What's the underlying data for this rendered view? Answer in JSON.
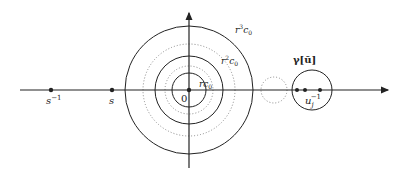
{
  "diagram": {
    "origin": {
      "x": 189,
      "y": 90,
      "label": "0"
    },
    "axes": {
      "horizontal": {
        "x1": 20,
        "x2": 388,
        "y": 90
      },
      "vertical": {
        "x": 189,
        "y1": 12,
        "y2": 168
      }
    },
    "points_left": [
      {
        "x": 51,
        "label": "s",
        "sup": "−1"
      },
      {
        "x": 112,
        "label": "s",
        "sup": ""
      }
    ],
    "rings": [
      {
        "r": 17,
        "style": "solid",
        "label": "r",
        "sub": "0",
        "var": "c",
        "power": ""
      },
      {
        "r": 24,
        "style": "dotted"
      },
      {
        "r": 34,
        "style": "solid",
        "label": "r",
        "sub": "0",
        "var": "c",
        "power": "2"
      },
      {
        "r": 46,
        "style": "dotted"
      },
      {
        "r": 64,
        "style": "solid",
        "label": "r",
        "sub": "0",
        "var": "c",
        "power": "3"
      }
    ],
    "ring_labels": {
      "r1": "rc",
      "r1_sub": "0",
      "r2": "r",
      "r2_sup": "2",
      "r2_c": "c",
      "r2_sub": "0",
      "r3": "r",
      "r3_sup": "3",
      "r3_c": "c",
      "r3_sub": "0"
    },
    "dotted_circle": {
      "cx": 274,
      "cy": 90,
      "r": 13
    },
    "gamma_circle": {
      "cx": 312,
      "cy": 90,
      "r": 20,
      "label": "γ[ū]"
    },
    "gamma_points": [
      297,
      305,
      320
    ],
    "u_label": {
      "base": "u",
      "sub": "j",
      "sup": "−1"
    },
    "colors": {
      "stroke": "#222222",
      "dotted": "#888888",
      "background": "#ffffff"
    }
  }
}
